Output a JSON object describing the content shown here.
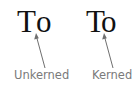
{
  "figure": {
    "topic": "Kerning comparison",
    "examples": [
      {
        "id": "unkerned",
        "glyph_1": "T",
        "glyph_2": "o",
        "label": "Unkerned"
      },
      {
        "id": "kerned",
        "glyph_1": "T",
        "glyph_2": "o",
        "label": "Kerned"
      }
    ]
  },
  "colors": {
    "glyph": "#111111",
    "label": "#7a7a7a",
    "arrow": "#6f6f6f",
    "background": "#ffffff"
  }
}
